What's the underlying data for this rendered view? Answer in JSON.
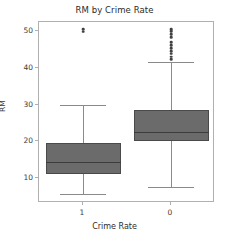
{
  "chart_data": {
    "type": "box",
    "title": "RM by Crime Rate",
    "xlabel": "Crime Rate",
    "ylabel": "RM",
    "grid": false,
    "legend": null,
    "ylim": [
      3.2,
      52.5
    ],
    "yticks": [
      10,
      20,
      30,
      40,
      50
    ],
    "ytick_labels": [
      "10",
      "20",
      "30",
      "40",
      "50"
    ],
    "categories": [
      "1",
      "0"
    ],
    "xtick_labels": [
      "1",
      "0"
    ],
    "boxes": [
      {
        "category": "1",
        "whisker_low": 5.6,
        "q1": 11.2,
        "median": 14.3,
        "q3": 19.5,
        "whisker_high": 30.0,
        "outliers": [
          49.9,
          50.6
        ]
      },
      {
        "category": "0",
        "whisker_low": 7.5,
        "q1": 20.0,
        "median": 22.6,
        "q3": 28.5,
        "whisker_high": 41.7,
        "outliers": [
          42.4,
          43.1,
          43.9,
          44.6,
          45.4,
          46.2,
          47.0,
          48.3,
          49.2,
          50.0,
          50.6
        ]
      }
    ],
    "colors": {
      "box_fill": "#6b6b6b",
      "box_edge": "#4a4a4a",
      "median": "#3c3c3c",
      "whisker": "#8a8a8a",
      "flier": "#404040",
      "frame": "#b0b0b0",
      "background": "#ffffff",
      "text": "#2b2b2b"
    }
  }
}
